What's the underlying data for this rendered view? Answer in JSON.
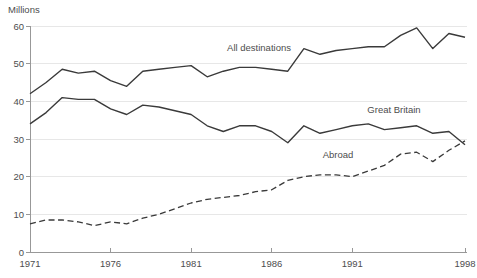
{
  "chart_data": {
    "type": "line",
    "title": "",
    "ylabel": "Millions",
    "xlabel": "",
    "legend": "inline-labels",
    "grid": true,
    "ylim": [
      0,
      60
    ],
    "yticks": [
      0,
      10,
      20,
      30,
      40,
      50,
      60
    ],
    "xticks": [
      {
        "year": 1971,
        "label": "1971"
      },
      {
        "year": 1976,
        "label": "1976"
      },
      {
        "year": 1981,
        "label": "1981"
      },
      {
        "year": 1986,
        "label": "1986"
      },
      {
        "year": 1991,
        "label": "1991"
      },
      {
        "year": 1998,
        "label": "1998"
      }
    ],
    "x": [
      1971,
      1972,
      1973,
      1974,
      1975,
      1976,
      1977,
      1978,
      1979,
      1980,
      1981,
      1982,
      1983,
      1984,
      1985,
      1986,
      1987,
      1988,
      1989,
      1990,
      1991,
      1992,
      1993,
      1994,
      1995,
      1996,
      1997,
      1998
    ],
    "series": [
      {
        "name": "All destinations",
        "line_style": "solid",
        "values": [
          42,
          45,
          48.5,
          47.5,
          48,
          45.5,
          44,
          48,
          48.5,
          49,
          49.5,
          46.5,
          48,
          49,
          49,
          48.5,
          48,
          54,
          52.5,
          53.5,
          54,
          54.5,
          54.5,
          57.5,
          59.5,
          54,
          58,
          57
        ],
        "label": {
          "x": 259,
          "y": 51
        }
      },
      {
        "name": "Great Britain",
        "line_style": "solid",
        "values": [
          34,
          37,
          41,
          40.5,
          40.5,
          38,
          36.5,
          39,
          38.5,
          37.5,
          36.5,
          33.5,
          32,
          33.5,
          33.5,
          32,
          29,
          33.5,
          31.5,
          32.5,
          33.5,
          34,
          32.5,
          33,
          33.5,
          31.5,
          32,
          28.5
        ],
        "label": {
          "x": 394,
          "y": 113
        }
      },
      {
        "name": "Abroad",
        "line_style": "dashed",
        "values": [
          7.5,
          8.5,
          8.5,
          8,
          7,
          8,
          7.5,
          9,
          10,
          11.5,
          13,
          14,
          14.5,
          15,
          16,
          16.5,
          19,
          20,
          20.5,
          20.5,
          20,
          21.5,
          23,
          26,
          26.5,
          24,
          27,
          29.5
        ],
        "label": {
          "x": 338,
          "y": 158
        }
      }
    ],
    "colors": {
      "line": "#3a3a3a",
      "grid": "#e7e7e7",
      "axis": "#989898",
      "text": "#4d4d4d",
      "background": "#ffffff"
    }
  }
}
